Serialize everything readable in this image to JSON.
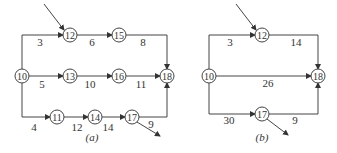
{
  "diagrams": [
    {
      "caption": "(a)",
      "nodes": [
        "10",
        "12",
        "15",
        "18",
        "13",
        "16",
        "11",
        "14",
        "17"
      ],
      "edges": [
        {
          "from": "10",
          "to": "12",
          "label": "3"
        },
        {
          "from": "12",
          "to": "15",
          "label": "6"
        },
        {
          "from": "15",
          "to": "18",
          "label": "8"
        },
        {
          "from": "10",
          "to": "13",
          "label": "5"
        },
        {
          "from": "13",
          "to": "16",
          "label": "10"
        },
        {
          "from": "16",
          "to": "18",
          "label": "11"
        },
        {
          "from": "10",
          "to": "11",
          "label": "4"
        },
        {
          "from": "11",
          "to": "14",
          "label": "12"
        },
        {
          "from": "14",
          "to": "17",
          "label": "14"
        },
        {
          "from": "17",
          "to": "18",
          "label": "9"
        }
      ]
    },
    {
      "caption": "(b)",
      "nodes": [
        "10",
        "12",
        "18",
        "17"
      ],
      "edges": [
        {
          "from": "10",
          "to": "12",
          "label": "3"
        },
        {
          "from": "12",
          "to": "18",
          "label": "14"
        },
        {
          "from": "10",
          "to": "18",
          "label": "26"
        },
        {
          "from": "10",
          "to": "17",
          "label": "30"
        },
        {
          "from": "17",
          "to": "18",
          "label": "9"
        }
      ]
    }
  ]
}
